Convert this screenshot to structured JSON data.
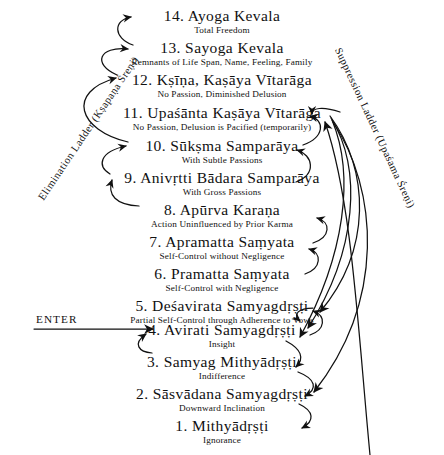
{
  "diagram": {
    "enter_label": "ENTER",
    "ladders": {
      "left": "Elimination Ladder (Kṣapaṇa Śreṇi)",
      "right": "Suppression Ladder (Upaśama Śreṇi)"
    },
    "stages": [
      {
        "number": "14.",
        "title": "14. Ayoga Kevala",
        "name": "Ayoga Kevala",
        "subtitle": "Total Freedom"
      },
      {
        "number": "13.",
        "title": "13. Sayoga Kevala",
        "name": "Sayoga Kevala",
        "subtitle": "Remnants of Life Span, Name, Feeling, Family"
      },
      {
        "number": "12.",
        "title": "12. Kṣīṇa, Kaṣāya Vītarāga",
        "name": "Kṣīṇa, Kaṣāya Vītarāga",
        "subtitle": "No Passion, Diminished Delusion"
      },
      {
        "number": "11.",
        "title": "11. Upaśānta Kaṣāya Vītarāga",
        "name": "Upaśānta Kaṣāya Vītarāga",
        "subtitle": "No Passion, Delusion is Pacified (temporarily)"
      },
      {
        "number": "10.",
        "title": "10. Sūkṣma Samparāya",
        "name": "Sūkṣma Samparāya",
        "subtitle": "With Subtle Passions"
      },
      {
        "number": "9.",
        "title": "9. Anivṛtti Bādara Samparāya",
        "name": "Anivṛtti Bādara Samparāya",
        "subtitle": "With Gross Passions"
      },
      {
        "number": "8.",
        "title": "8. Apūrva Karaṇa",
        "name": "Apūrva Karaṇa",
        "subtitle": "Action Uninfluenced by Prior Karma"
      },
      {
        "number": "7.",
        "title": "7. Apramatta Saṃyata",
        "name": "Apramatta Saṃyata",
        "subtitle": "Self-Control without Negligence"
      },
      {
        "number": "6.",
        "title": "6. Pramatta Saṃyata",
        "name": "Pramatta Saṃyata",
        "subtitle": "Self-Control with Negligence"
      },
      {
        "number": "5.",
        "title": "5. Deśavirata Samyagdṛṣṭi",
        "name": "Deśavirata Samyagdṛṣṭi",
        "subtitle": "Partial Self-Control through Adherence to Vows"
      },
      {
        "number": "4.",
        "title": "4. Avirati Samyagdṛṣṭi",
        "name": "Avirati Samyagdṛṣṭi",
        "subtitle": "Insight"
      },
      {
        "number": "3.",
        "title": "3. Samyag Mithyādṛṣṭi",
        "name": "Samyag Mithyādṛṣṭi",
        "subtitle": "Indifference"
      },
      {
        "number": "2.",
        "title": "2. Sāsvādana Samyagdṛṣṭi",
        "name": "Sāsvādana Samyagdṛṣṭi",
        "subtitle": "Downward Inclination"
      },
      {
        "number": "1.",
        "title": "1. Mithyādṛṣṭi",
        "name": "Mithyādṛṣṭi",
        "subtitle": "Ignorance"
      }
    ],
    "colors": {
      "ink": "#111111",
      "background": "#ffffff"
    }
  }
}
